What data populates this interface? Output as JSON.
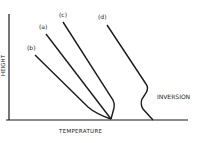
{
  "diagram": {
    "title": "",
    "x_axis_label": "TEMPERATURE",
    "y_axis_label": "HEIGHT",
    "curves": [
      {
        "id": "b",
        "label": "(b)"
      },
      {
        "id": "a",
        "label": "(a)"
      },
      {
        "id": "c",
        "label": "(c)"
      },
      {
        "id": "d",
        "label": "(d)"
      }
    ],
    "annotation": "INVERSION",
    "colors": {
      "line": "#1a1a1a",
      "background": "#ffffff"
    }
  }
}
